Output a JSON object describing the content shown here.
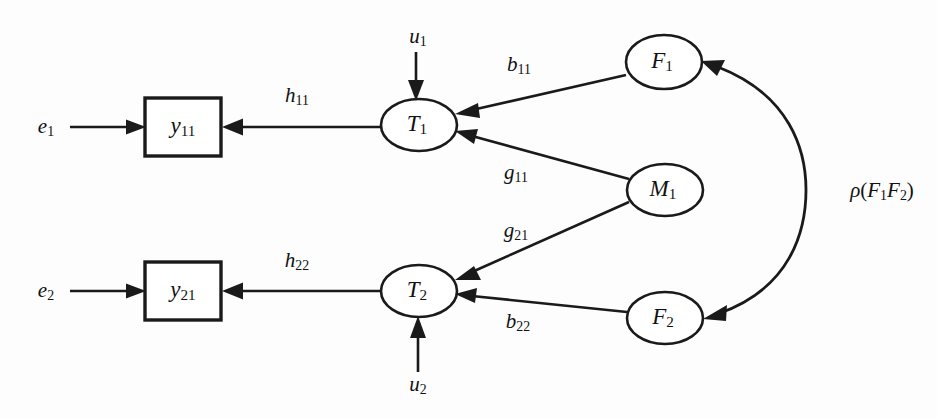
{
  "figure": {
    "type": "path-diagram",
    "background_color": "#fdfdfd",
    "stroke_color": "#1a1a1a",
    "width": 937,
    "height": 418
  },
  "nodes": {
    "observed_1": {
      "label_base": "y",
      "label_sub": "11",
      "shape": "rectangle",
      "x": 183,
      "y": 127,
      "w": 76,
      "h": 58
    },
    "observed_2": {
      "label_base": "y",
      "label_sub": "21",
      "shape": "rectangle",
      "x": 183,
      "y": 291,
      "w": 76,
      "h": 58
    },
    "true_1": {
      "label_base": "T",
      "label_sub": "1",
      "shape": "ellipse",
      "x": 419,
      "y": 125,
      "rx": 38,
      "ry": 26
    },
    "true_2": {
      "label_base": "T",
      "label_sub": "2",
      "shape": "ellipse",
      "x": 419,
      "y": 291,
      "rx": 38,
      "ry": 26
    },
    "factor_1": {
      "label_base": "F",
      "label_sub": "1",
      "shape": "ellipse",
      "x": 664,
      "y": 62,
      "rx": 38,
      "ry": 27
    },
    "method_1": {
      "label_base": "M",
      "label_sub": "1",
      "shape": "ellipse",
      "x": 665,
      "y": 190,
      "rx": 38,
      "ry": 26
    },
    "factor_2": {
      "label_base": "F",
      "label_sub": "2",
      "shape": "ellipse",
      "x": 665,
      "y": 318,
      "rx": 38,
      "ry": 26
    }
  },
  "residuals": {
    "error_1": {
      "label_base": "e",
      "label_sub": "1",
      "x": 46,
      "y": 127
    },
    "error_2": {
      "label_base": "e",
      "label_sub": "2",
      "x": 46,
      "y": 291
    },
    "disturbance_1": {
      "label_base": "u",
      "label_sub": "1",
      "x": 418,
      "y": 38
    },
    "disturbance_2": {
      "label_base": "u",
      "label_sub": "2",
      "x": 418,
      "y": 386
    }
  },
  "edges": [
    {
      "name": "e1-to-y11",
      "from": "error_1",
      "to": "observed_1",
      "label_base": "",
      "label_sub": "",
      "label_x": 0,
      "label_y": 0
    },
    {
      "name": "e2-to-y21",
      "from": "error_2",
      "to": "observed_2",
      "label_base": "",
      "label_sub": "",
      "label_x": 0,
      "label_y": 0
    },
    {
      "name": "T1-to-y11",
      "from": "true_1",
      "to": "observed_1",
      "label_base": "h",
      "label_sub": "11",
      "label_x": 297,
      "label_y": 97
    },
    {
      "name": "T2-to-y21",
      "from": "true_2",
      "to": "observed_2",
      "label_base": "h",
      "label_sub": "22",
      "label_x": 297,
      "label_y": 262
    },
    {
      "name": "u1-to-T1",
      "from": "disturbance_1",
      "to": "true_1",
      "label_base": "",
      "label_sub": "",
      "label_x": 0,
      "label_y": 0
    },
    {
      "name": "u2-to-T2",
      "from": "disturbance_2",
      "to": "true_2",
      "label_base": "",
      "label_sub": "",
      "label_x": 0,
      "label_y": 0
    },
    {
      "name": "F1-to-T1",
      "from": "factor_1",
      "to": "true_1",
      "label_base": "b",
      "label_sub": "11",
      "label_x": 519,
      "label_y": 66
    },
    {
      "name": "M1-to-T1",
      "from": "method_1",
      "to": "true_1",
      "label_base": "g",
      "label_sub": "11",
      "label_x": 516,
      "label_y": 174
    },
    {
      "name": "M1-to-T2",
      "from": "method_1",
      "to": "true_2",
      "label_base": "g",
      "label_sub": "21",
      "label_x": 516,
      "label_y": 232
    },
    {
      "name": "F2-to-T2",
      "from": "factor_2",
      "to": "true_2",
      "label_base": "b",
      "label_sub": "22",
      "label_x": 518,
      "label_y": 323
    }
  ],
  "correlation": {
    "name": "F1-F2-correlation",
    "rho": "ρ",
    "open_paren": "(",
    "first_base": "F",
    "first_sub": "1",
    "second_base": "F",
    "second_sub": "2",
    "close_paren": ")",
    "label_x": 828,
    "label_y": 190
  }
}
